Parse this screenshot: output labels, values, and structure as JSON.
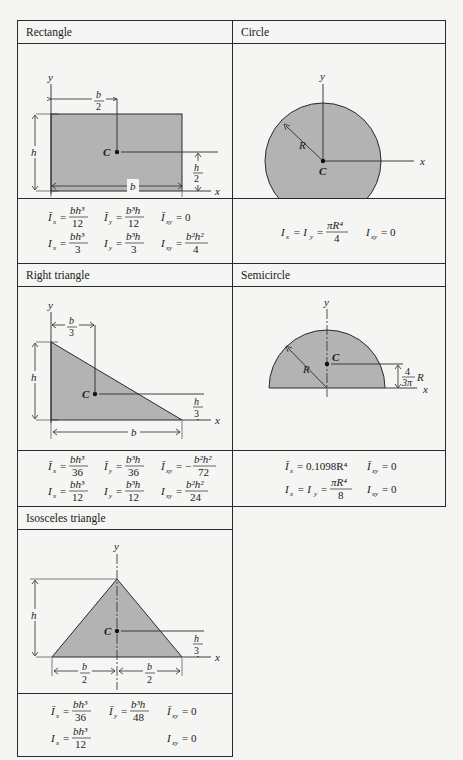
{
  "table": {
    "cells": [
      {
        "title": "Rectangle",
        "labels": {
          "y": "y",
          "x": "x",
          "h": "h",
          "b": "b",
          "C": "C",
          "b_over": "b",
          "b_under": "2",
          "h_over": "h",
          "h_under": "2"
        },
        "formulas": {
          "row1": [
            {
              "lhs": "Ī",
              "sub": "x",
              "eq": "=",
              "num": "bh³",
              "den": "12"
            },
            {
              "lhs": "Ī",
              "sub": "y",
              "eq": "=",
              "num": "b³h",
              "den": "12"
            },
            {
              "lhs": "Ī",
              "sub": "xy",
              "eq": "= 0"
            }
          ],
          "row2": [
            {
              "lhs": "I",
              "sub": "x",
              "eq": "=",
              "num": "bh³",
              "den": "3"
            },
            {
              "lhs": "I",
              "sub": "y",
              "eq": "=",
              "num": "b³h",
              "den": "3"
            },
            {
              "lhs": "I",
              "sub": "xy",
              "eq": "=",
              "num": "b²h²",
              "den": "4"
            }
          ]
        }
      },
      {
        "title": "Circle",
        "labels": {
          "y": "y",
          "x": "x",
          "R": "R",
          "C": "C"
        },
        "formulas": {
          "row1": [
            {
              "lhs": "I",
              "sub": "x",
              "eq": "= I",
              "sub2": "y",
              "eq2": "=",
              "num": "πR⁴",
              "den": "4"
            },
            {
              "lhs": "I",
              "sub": "xy",
              "eq": "= 0"
            }
          ]
        }
      },
      {
        "title": "Right triangle",
        "labels": {
          "y": "y",
          "x": "x",
          "h": "h",
          "b": "b",
          "C": "C",
          "b_over": "b",
          "b_under": "3",
          "h_over": "h",
          "h_under": "3"
        },
        "formulas": {
          "row1": [
            {
              "lhs": "Ī",
              "sub": "x",
              "eq": "=",
              "num": "bh³",
              "den": "36"
            },
            {
              "lhs": "Ī",
              "sub": "y",
              "eq": "=",
              "num": "b³h",
              "den": "36"
            },
            {
              "lhs": "Ī",
              "sub": "xy",
              "eq": "= −",
              "num": "b²h²",
              "den": "72"
            }
          ],
          "row2": [
            {
              "lhs": "I",
              "sub": "x",
              "eq": "=",
              "num": "bh³",
              "den": "12"
            },
            {
              "lhs": "I",
              "sub": "y",
              "eq": "=",
              "num": "b³h",
              "den": "12"
            },
            {
              "lhs": "I",
              "sub": "xy",
              "eq": "=",
              "num": "b²h²",
              "den": "24"
            }
          ]
        }
      },
      {
        "title": "Semicircle",
        "labels": {
          "y": "y",
          "x": "x",
          "R": "R",
          "C": "C",
          "dist_num": "4",
          "dist_den": "3π",
          "dist_R": "R"
        },
        "formulas": {
          "row1": [
            {
              "lhs": "Ī",
              "sub": "x",
              "eq": "= 0.1098R⁴"
            },
            {
              "lhs": "Ī",
              "sub": "xy",
              "eq": "= 0"
            }
          ],
          "row2": [
            {
              "lhs": "I",
              "sub": "x",
              "eq": "= I",
              "sub2": "y",
              "eq2": "=",
              "num": "πR⁴",
              "den": "8"
            },
            {
              "lhs": "I",
              "sub": "xy",
              "eq": "= 0"
            }
          ]
        }
      },
      {
        "title": "Isosceles triangle",
        "labels": {
          "y": "y",
          "x": "x",
          "h": "h",
          "C": "C",
          "b1_over": "b",
          "b1_under": "2",
          "b2_over": "b",
          "b2_under": "2",
          "h_over": "h",
          "h_under": "3"
        },
        "formulas": {
          "row1": [
            {
              "lhs": "Ī",
              "sub": "x",
              "eq": "=",
              "num": "bh³",
              "den": "36"
            },
            {
              "lhs": "Ī",
              "sub": "y",
              "eq": "=",
              "num": "b³h",
              "den": "48"
            },
            {
              "lhs": "Ī",
              "sub": "xy",
              "eq": "= 0"
            }
          ],
          "row2": [
            {
              "lhs": "I",
              "sub": "x",
              "eq": "=",
              "num": "bh³",
              "den": "12"
            },
            {
              "lhs": "I",
              "sub": "xy",
              "eq": "= 0"
            }
          ]
        }
      }
    ],
    "colors": {
      "fill": "#b3b3b3",
      "line": "#2a2a2a",
      "background": "#f5f5f3"
    }
  }
}
